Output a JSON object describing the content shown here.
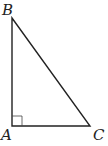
{
  "diagram": {
    "type": "right-triangle",
    "vertices": [
      {
        "label": "B",
        "x": 12,
        "y": 18
      },
      {
        "label": "A",
        "x": 12,
        "y": 126
      },
      {
        "label": "C",
        "x": 90,
        "y": 126
      }
    ],
    "right_angle_at": "A",
    "stroke_color": "#222222"
  }
}
